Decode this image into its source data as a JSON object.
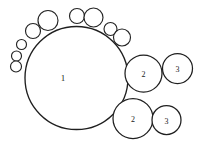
{
  "figure": {
    "background_color": "#ffffff",
    "stroke_color": "#1f1f1f",
    "label_color": "#1a1a1a",
    "width": 203,
    "height": 146,
    "main_circle": {
      "label": "1",
      "cx": 76.5,
      "cy": 78,
      "r": 51.5,
      "label_x": 63,
      "label_y": 79
    },
    "medium_circles": [
      {
        "label": "2",
        "cx": 143.5,
        "cy": 73.5,
        "r": 18.5,
        "label_x": 143.5,
        "label_y": 75.5
      },
      {
        "label": "3",
        "cx": 177.5,
        "cy": 68.5,
        "r": 15.0,
        "label_x": 177.5,
        "label_y": 70.5
      },
      {
        "label": "2",
        "cx": 133.0,
        "cy": 118.5,
        "r": 20.0,
        "label_x": 133.0,
        "label_y": 120.5
      },
      {
        "label": "3",
        "cx": 166.5,
        "cy": 120.0,
        "r": 14.5,
        "label_x": 166.5,
        "label_y": 122.0
      }
    ],
    "small_circles": [
      {
        "cx": 48.0,
        "cy": 20.5,
        "r": 10.0
      },
      {
        "cx": 33.0,
        "cy": 31.0,
        "r": 7.5
      },
      {
        "cx": 21.5,
        "cy": 44.5,
        "r": 5.0
      },
      {
        "cx": 16.5,
        "cy": 56.0,
        "r": 5.0
      },
      {
        "cx": 16.0,
        "cy": 66.5,
        "r": 5.5
      },
      {
        "cx": 77.0,
        "cy": 16.0,
        "r": 7.5
      },
      {
        "cx": 93.5,
        "cy": 17.5,
        "r": 9.5
      },
      {
        "cx": 110.5,
        "cy": 29.0,
        "r": 6.5
      },
      {
        "cx": 122.0,
        "cy": 37.5,
        "r": 8.5
      }
    ]
  }
}
